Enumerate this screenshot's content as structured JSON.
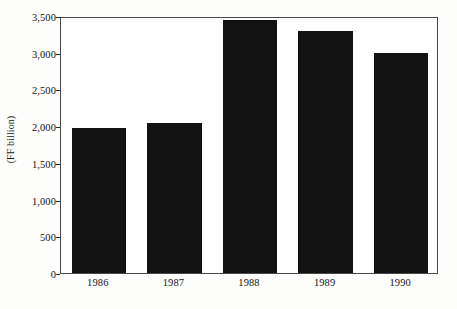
{
  "chart_data": {
    "type": "bar",
    "title": "",
    "subtitle": "",
    "xlabel": "",
    "ylabel": "(FF billion)",
    "categories": [
      "1986",
      "1987",
      "1988",
      "1989",
      "1990"
    ],
    "values": [
      1975,
      2050,
      3450,
      3300,
      3000
    ],
    "series": [
      {
        "name": "",
        "values": [
          1975,
          2050,
          3450,
          3300,
          3000
        ]
      }
    ],
    "ylim": [
      0,
      3500
    ],
    "yticks": [
      0,
      500,
      1000,
      1500,
      2000,
      2500,
      3000,
      3500
    ],
    "ytick_labels": [
      "0",
      "500",
      "1,000",
      "1,500",
      "2,000",
      "2,500",
      "3,000",
      "3,500"
    ],
    "grid": false,
    "legend": false,
    "legend_position": "none",
    "bar_color": "#121212",
    "frame_color": "#4a4a4a",
    "background_color": "#ffffff",
    "text_color": "#141414"
  }
}
